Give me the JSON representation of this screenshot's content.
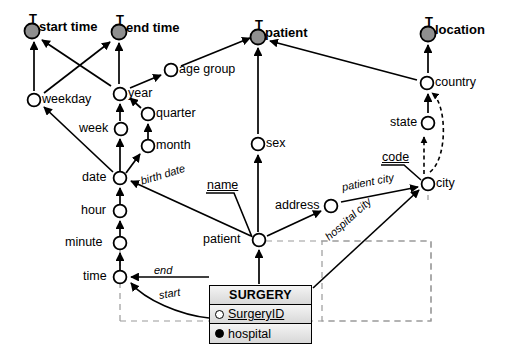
{
  "diagram": {
    "colors": {
      "top_node_fill": "#8f8f8f",
      "node_fill": "#ffffff",
      "stroke": "#000000",
      "entity_header_fill": "#dcdcdc",
      "dashed_region": "#999999"
    },
    "top_nodes": [
      {
        "id": "start-time",
        "label": "start time",
        "marker": "T",
        "x": 32,
        "y": 31
      },
      {
        "id": "end-time",
        "label": "end time",
        "marker": "T",
        "x": 119,
        "y": 32
      },
      {
        "id": "patient-top",
        "label": "patient",
        "marker": "T",
        "x": 258,
        "y": 37
      },
      {
        "id": "location",
        "label": "location",
        "marker": "T",
        "x": 428,
        "y": 34
      }
    ],
    "nodes": [
      {
        "id": "age-group",
        "label": "age group",
        "x": 171,
        "y": 70,
        "label_side": "right"
      },
      {
        "id": "country",
        "label": "country",
        "x": 427,
        "y": 83,
        "label_side": "right"
      },
      {
        "id": "weekday",
        "label": "weekday",
        "x": 34,
        "y": 100,
        "label_side": "right"
      },
      {
        "id": "year",
        "label": "year",
        "x": 120,
        "y": 94,
        "label_side": "right"
      },
      {
        "id": "quarter",
        "label": "quarter",
        "x": 148,
        "y": 114,
        "label_side": "right"
      },
      {
        "id": "state",
        "label": "state",
        "x": 428,
        "y": 123,
        "label_side": "left"
      },
      {
        "id": "week",
        "label": "week",
        "x": 121,
        "y": 129,
        "label_side": "left"
      },
      {
        "id": "sex",
        "label": "sex",
        "x": 258,
        "y": 144,
        "label_side": "right"
      },
      {
        "id": "month",
        "label": "month",
        "x": 148,
        "y": 146,
        "label_side": "right"
      },
      {
        "id": "date",
        "label": "date",
        "x": 120,
        "y": 178,
        "label_side": "left"
      },
      {
        "id": "city",
        "label": "city",
        "x": 428,
        "y": 184,
        "label_side": "right"
      },
      {
        "id": "address",
        "label": "address",
        "x": 331,
        "y": 206,
        "label_side": "left"
      },
      {
        "id": "hour",
        "label": "hour",
        "x": 120,
        "y": 211,
        "label_side": "left"
      },
      {
        "id": "minute",
        "label": "minute",
        "x": 120,
        "y": 243,
        "label_side": "left"
      },
      {
        "id": "patient",
        "label": "patient",
        "x": 259,
        "y": 240,
        "label_side": "left"
      },
      {
        "id": "time",
        "label": "time",
        "x": 120,
        "y": 277,
        "label_side": "left"
      }
    ],
    "attribute_labels": [
      {
        "id": "name",
        "label": "name",
        "x": 207,
        "y": 186
      },
      {
        "id": "code",
        "label": "code",
        "x": 382,
        "y": 158
      }
    ],
    "edge_labels": [
      {
        "id": "birth-date",
        "label": "birth date",
        "x": 141,
        "y": 180,
        "rotate": -17
      },
      {
        "id": "patient-city",
        "label": "patient city",
        "x": 342,
        "y": 186,
        "rotate": -17
      },
      {
        "id": "hospital-city",
        "label": "hospital city",
        "x": 330,
        "y": 233,
        "rotate": -36
      },
      {
        "id": "end",
        "label": "end",
        "x": 154,
        "y": 270,
        "rotate": 0
      },
      {
        "id": "start",
        "label": "start",
        "x": 157,
        "y": 293,
        "rotate": -8
      }
    ],
    "entity": {
      "name": "SURGERY",
      "attributes": [
        {
          "label": "SurgeryID",
          "key": true,
          "bullet": "hollow",
          "underlined": true
        },
        {
          "label": "hospital",
          "key": false,
          "bullet": "filled",
          "underlined": false
        }
      ]
    }
  }
}
